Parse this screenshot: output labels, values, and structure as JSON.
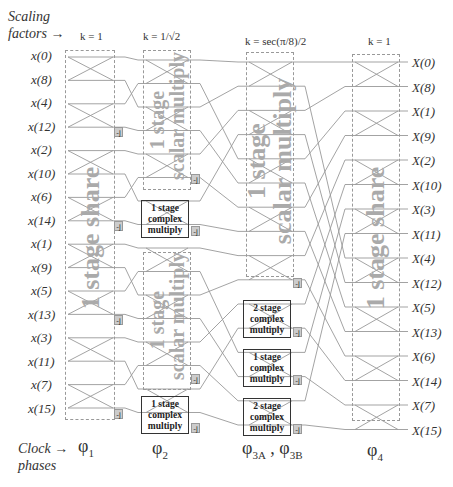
{
  "header": {
    "scaling_label": "Scaling factors →",
    "scaling_line1": "Scaling",
    "scaling_line2": "factors →",
    "clock_line1": "Clock →",
    "clock_line2": "phases"
  },
  "scaling_factors": [
    {
      "stage": 1,
      "label": "k = 1"
    },
    {
      "stage": 2,
      "label": "k = 1/√2"
    },
    {
      "stage": 3,
      "label": "k = sec(π/8)/2"
    },
    {
      "stage": 4,
      "label": "k = 1"
    }
  ],
  "inputs": [
    "x(0)",
    "x(8)",
    "x(4)",
    "x(12)",
    "x(2)",
    "x(10)",
    "x(6)",
    "x(14)",
    "x(1)",
    "x(9)",
    "x(5)",
    "x(13)",
    "x(3)",
    "x(11)",
    "x(7)",
    "x(15)"
  ],
  "outputs": [
    "X(0)",
    "X(8)",
    "X(1)",
    "X(9)",
    "X(2)",
    "X(10)",
    "X(3)",
    "X(11)",
    "X(4)",
    "X(12)",
    "X(5)",
    "X(13)",
    "X(6)",
    "X(14)",
    "X(7)",
    "X(15)"
  ],
  "stage_labels": {
    "stage1": "1 stage share",
    "stage2_top_l1": "1 stage",
    "stage2_top_l2": "scalar multiply",
    "stage2_bot_l1": "1 stage",
    "stage2_bot_l2": "scalar multiply",
    "stage3_l1": "1 stage",
    "stage3_l2": "scalar multiply",
    "stage4": "1 stage share"
  },
  "complex_multipliers": [
    {
      "id": "s2-a",
      "l1": "1 stage",
      "l2": "complex",
      "l3": "multiply"
    },
    {
      "id": "s2-b",
      "l1": "1 stage",
      "l2": "complex",
      "l3": "multiply"
    },
    {
      "id": "s3-a",
      "l1": "2 stage",
      "l2": "complex",
      "l3": "multiply"
    },
    {
      "id": "s3-b",
      "l1": "1 stage",
      "l2": "complex",
      "l3": "multiply"
    },
    {
      "id": "s3-c",
      "l1": "2 stage",
      "l2": "complex",
      "l3": "multiply"
    }
  ],
  "twiddle_label": "-j",
  "clock_phases": [
    {
      "sym": "φ",
      "sub": "1"
    },
    {
      "sym": "φ",
      "sub": "2"
    },
    {
      "sym": "φ",
      "sub": "3A",
      "sep": " , ",
      "sym2": "φ",
      "sub2": "3B"
    },
    {
      "sym": "φ",
      "sub": "4"
    }
  ],
  "colors": {
    "wire": "#999999",
    "box_border": "#333333",
    "stage_text": "#aaaaaa",
    "jbox_fill": "#cccccc"
  }
}
